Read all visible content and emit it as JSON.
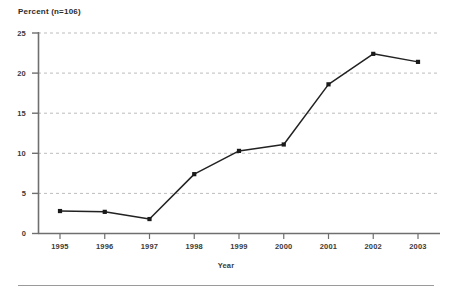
{
  "chart_data": {
    "type": "line",
    "title": "Percent (n=106)",
    "xlabel": "Year",
    "ylabel": "",
    "categories": [
      "1995",
      "1996",
      "1997",
      "1998",
      "1999",
      "2000",
      "2001",
      "2002",
      "2003"
    ],
    "values": [
      2.8,
      2.7,
      1.8,
      7.4,
      10.3,
      11.1,
      18.6,
      22.4,
      21.4
    ],
    "xlim": [
      1995,
      2003
    ],
    "ylim": [
      0,
      25
    ],
    "yticks": [
      0,
      5,
      10,
      15,
      20,
      25
    ],
    "ytick_labels": [
      "0",
      "5",
      "10",
      "15",
      "20",
      "25"
    ],
    "xticks": [
      "1995",
      "1996",
      "1997",
      "1998",
      "1999",
      "2000",
      "2001",
      "2002",
      "2003"
    ],
    "grid": true,
    "grid_axis": "y",
    "grid_style": "dashed",
    "legend": false,
    "legend_position": "none",
    "marker": "square",
    "series": [
      {
        "name": "Percent",
        "values": [
          2.8,
          2.7,
          1.8,
          7.4,
          10.3,
          11.1,
          18.6,
          22.4,
          21.4
        ]
      }
    ],
    "colors": {
      "line": "#222222",
      "marker": "#1a1a1a",
      "grid": "#bcbcbc",
      "axis": "#6f6f6f",
      "text": "#3a3a3a",
      "background": "#ffffff"
    }
  },
  "figure": {
    "bottom_rule": true
  }
}
